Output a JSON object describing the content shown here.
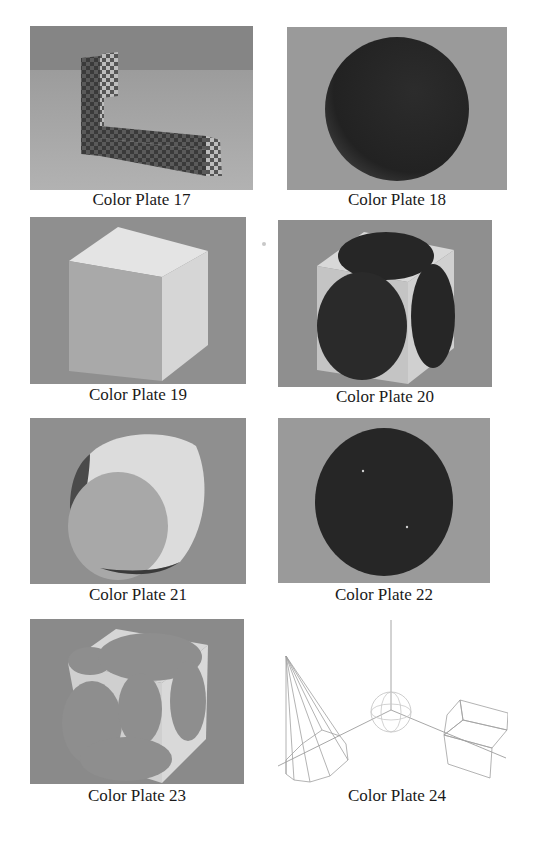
{
  "page": {
    "background": "#ffffff",
    "plates": [
      {
        "number": 17,
        "caption": "Color Plate 17",
        "subject": "checkered L-shaped block"
      },
      {
        "number": 18,
        "caption": "Color Plate 18",
        "subject": "dark sphere"
      },
      {
        "number": 19,
        "caption": "Color Plate 19",
        "subject": "white cube"
      },
      {
        "number": 20,
        "caption": "Color Plate 20",
        "subject": "cube with dark spherical intersections"
      },
      {
        "number": 21,
        "caption": "Color Plate 21",
        "subject": "rounded cube-sphere intersection"
      },
      {
        "number": 22,
        "caption": "Color Plate 22",
        "subject": "dark sphere with cube trim"
      },
      {
        "number": 23,
        "caption": "Color Plate 23",
        "subject": "cube with sphere cutouts"
      },
      {
        "number": 24,
        "caption": "Color Plate 24",
        "subject": "wireframe cone, sphere, box and axes"
      }
    ]
  },
  "colors": {
    "plate_bg": "#8e8e8e",
    "plate_floor": "#a3a3a3",
    "dark_object": "#2a2a2a",
    "light_face": "#dcdcdc",
    "caption_text": "#1a1a1a",
    "wire": "#a0a0a0"
  }
}
